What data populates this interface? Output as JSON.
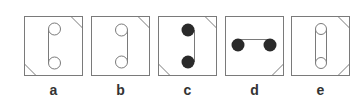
{
  "puzzle": {
    "stroke_color": "#7a7a7a",
    "fill_dark": "#2a2a2a",
    "options": [
      {
        "label": "a",
        "x": 24,
        "circles": "hollow",
        "orientation": "vertical",
        "connector": "single-line-center",
        "corners": [
          "top-right",
          "bottom-left"
        ]
      },
      {
        "label": "b",
        "x": 91,
        "circles": "hollow",
        "orientation": "vertical",
        "connector": "single-line-right",
        "corners": [
          "top-right"
        ]
      },
      {
        "label": "c",
        "x": 158,
        "circles": "filled",
        "orientation": "vertical",
        "connector": "single-line-right",
        "corners": [
          "top-right",
          "bottom-left"
        ]
      },
      {
        "label": "d",
        "x": 225,
        "circles": "filled",
        "orientation": "horizontal",
        "connector": "single-line-top",
        "corners": [
          "bottom-right"
        ]
      },
      {
        "label": "e",
        "x": 291,
        "circles": "hollow",
        "orientation": "vertical",
        "connector": "double-line",
        "corners": [
          "top-right",
          "bottom-right"
        ]
      }
    ]
  }
}
